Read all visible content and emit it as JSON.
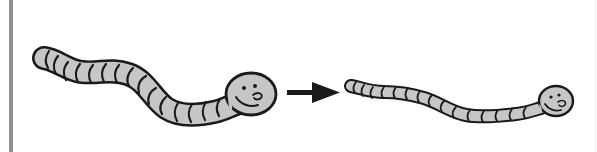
{
  "figure": {
    "description": "Long worm becomes a thinner, stretched worm",
    "colors": {
      "background": "#ffffff",
      "border_bar": "#8e8e8e",
      "worm_fill": "#c6c6c6",
      "outline": "#1a1a1a",
      "arrow": "#1a1a1a"
    },
    "left_worm": {
      "label": "thick worm",
      "segments": 15,
      "face": "smiling"
    },
    "arrow": {
      "label": "arrow-right",
      "direction": "right"
    },
    "right_worm": {
      "label": "thin stretched worm",
      "segments": 15,
      "face": "smiling"
    }
  }
}
